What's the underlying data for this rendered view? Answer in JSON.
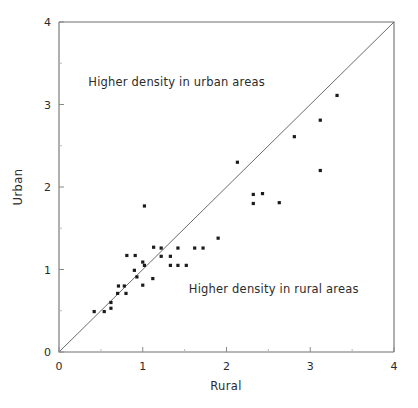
{
  "chart_data": {
    "type": "scatter",
    "title": "",
    "xlabel": "Rural",
    "ylabel": "Urban",
    "xlim": [
      0,
      4
    ],
    "ylim": [
      0,
      4
    ],
    "grid": false,
    "legend": "none",
    "xticks": [
      "0",
      "1",
      "2",
      "3",
      "4"
    ],
    "yticks": [
      "0",
      "1",
      "2",
      "3",
      "4"
    ],
    "xtick_values": [
      0,
      1,
      2,
      3,
      4
    ],
    "ytick_values": [
      0,
      1,
      2,
      3,
      4
    ],
    "minor_tick_values": [
      0.5,
      1.5,
      2.5,
      3.5
    ],
    "reference_line": {
      "name": "identity-line",
      "description": "y = x diagonal",
      "from": [
        0,
        0
      ],
      "to": [
        4,
        4
      ]
    },
    "annotations": [
      {
        "text": "Higher density in urban areas",
        "x": 0.35,
        "y": 3.22
      },
      {
        "text": "Higher density in rural areas",
        "x": 1.55,
        "y": 0.72
      }
    ],
    "points": [
      [
        0.42,
        0.49
      ],
      [
        0.54,
        0.49
      ],
      [
        0.62,
        0.53
      ],
      [
        0.62,
        0.6
      ],
      [
        0.7,
        0.71
      ],
      [
        0.71,
        0.8
      ],
      [
        0.78,
        0.8
      ],
      [
        0.8,
        0.71
      ],
      [
        0.81,
        1.17
      ],
      [
        0.9,
        0.99
      ],
      [
        0.91,
        1.17
      ],
      [
        0.93,
        0.91
      ],
      [
        1.0,
        1.09
      ],
      [
        1.0,
        0.81
      ],
      [
        1.02,
        1.05
      ],
      [
        1.02,
        1.77
      ],
      [
        1.12,
        0.89
      ],
      [
        1.13,
        1.27
      ],
      [
        1.22,
        1.26
      ],
      [
        1.22,
        1.16
      ],
      [
        1.33,
        1.16
      ],
      [
        1.33,
        1.05
      ],
      [
        1.42,
        1.26
      ],
      [
        1.42,
        1.05
      ],
      [
        1.52,
        1.05
      ],
      [
        1.62,
        1.26
      ],
      [
        1.72,
        1.26
      ],
      [
        1.9,
        1.38
      ],
      [
        2.13,
        2.3
      ],
      [
        2.32,
        1.91
      ],
      [
        2.43,
        1.92
      ],
      [
        2.32,
        1.8
      ],
      [
        2.63,
        1.81
      ],
      [
        2.81,
        2.61
      ],
      [
        3.12,
        2.81
      ],
      [
        3.12,
        2.2
      ],
      [
        3.32,
        3.11
      ]
    ]
  },
  "figure": {
    "point_color": "#1b1b1b",
    "axis_color": "#6e6e6e",
    "line_color": "#5a5a5a",
    "text_color": "#2b2b2b",
    "background": "#ffffff"
  }
}
